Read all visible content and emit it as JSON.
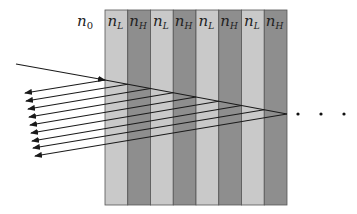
{
  "diagram": {
    "ambient_label": {
      "base": "n",
      "sub": "0"
    },
    "layers": [
      {
        "base": "n",
        "sub": "L",
        "type": "low"
      },
      {
        "base": "n",
        "sub": "H",
        "type": "high"
      },
      {
        "base": "n",
        "sub": "L",
        "type": "low"
      },
      {
        "base": "n",
        "sub": "H",
        "type": "high"
      },
      {
        "base": "n",
        "sub": "L",
        "type": "low"
      },
      {
        "base": "n",
        "sub": "H",
        "type": "high"
      },
      {
        "base": "n",
        "sub": "L",
        "type": "low"
      },
      {
        "base": "n",
        "sub": "H",
        "type": "high"
      }
    ],
    "colors": {
      "low": "#c9c9c9",
      "high": "#8e8e8e",
      "border": "#555555",
      "ray": "#1a1a1a"
    },
    "stack": {
      "left": 105,
      "top": 10,
      "bottom": 205,
      "layer_width": 22.75
    },
    "incident_ray": {
      "start": [
        16,
        64
      ],
      "enter": [
        105,
        80
      ],
      "end": [
        287,
        114
      ]
    },
    "reflected_tips": [
      [
        25,
        93
      ],
      [
        26,
        101
      ],
      [
        28,
        109
      ],
      [
        29,
        117
      ],
      [
        30,
        125
      ],
      [
        31,
        133
      ],
      [
        32,
        141
      ],
      [
        33,
        148
      ],
      [
        35,
        156
      ]
    ],
    "continuation": "· · ·",
    "continuation_dots": [
      [
        298,
        114
      ],
      [
        321,
        114
      ],
      [
        344,
        114
      ]
    ]
  }
}
